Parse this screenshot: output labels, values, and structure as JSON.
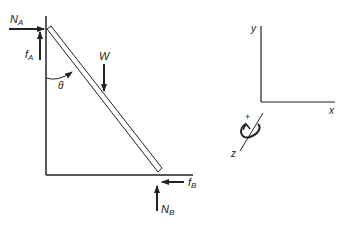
{
  "diagram": {
    "forces": {
      "normal_A": {
        "label": "N",
        "sub": "A"
      },
      "friction_A": {
        "label": "f",
        "sub": "A"
      },
      "weight": {
        "label": "W"
      },
      "friction_B": {
        "label": "f",
        "sub": "B"
      },
      "normal_B": {
        "label": "N",
        "sub": "B"
      }
    },
    "angle": {
      "label": "θ"
    },
    "axes": {
      "x": "x",
      "y": "y",
      "z": "z",
      "rotation_sign": "+"
    },
    "colors": {
      "stroke": "#222222",
      "background": "#ffffff"
    }
  }
}
